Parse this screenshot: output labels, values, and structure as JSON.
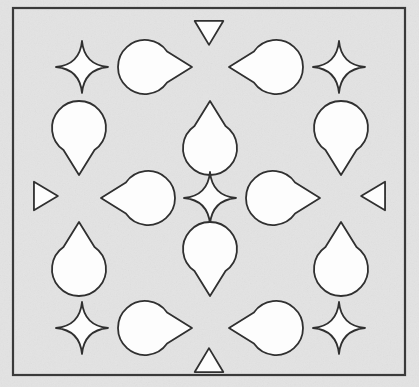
{
  "figure": {
    "canvas": {
      "width": 419,
      "height": 387
    }
  },
  "colors": {
    "page_background": "#ffffff",
    "panel_fill": "#e3e3e3",
    "panel_stroke": "#3a3a3a",
    "shape_fill": "#fdfdfd",
    "shape_stroke": "#303030",
    "noise": "#cfcfcf"
  },
  "frame": {
    "name": "panel-border",
    "x": 13,
    "y": 8,
    "width": 392,
    "height": 367,
    "stroke_width": 2.2
  },
  "geometry": {
    "stroke_width": 1.8,
    "star_radius_outer": 26,
    "star_radius_inner": 7,
    "teardrop_length": 74,
    "teardrop_round_radius": 27,
    "triangle_size": 26
  },
  "shapes": [
    {
      "id": "triangle-top",
      "kind": "triangle",
      "direction": "down",
      "cx": 209,
      "cy": 31,
      "size": 26,
      "label": "top edge triangle pointing down"
    },
    {
      "id": "star-top-left",
      "kind": "star4",
      "cx": 82,
      "cy": 67,
      "r_outer": 26,
      "r_inner": 7,
      "label": "top-left four-pointed star"
    },
    {
      "id": "teardrop-top-left",
      "kind": "teardrop",
      "direction": "right",
      "cx": 155,
      "cy": 67,
      "length": 74,
      "radius": 27,
      "label": "top-left teardrop pointing right"
    },
    {
      "id": "teardrop-top-right",
      "kind": "teardrop",
      "direction": "left",
      "cx": 266,
      "cy": 67,
      "length": 74,
      "radius": 27,
      "label": "top-right teardrop pointing left"
    },
    {
      "id": "star-top-right",
      "kind": "star4",
      "cx": 339,
      "cy": 67,
      "r_outer": 26,
      "r_inner": 7,
      "label": "top-right four-pointed star"
    },
    {
      "id": "teardrop-left-upper",
      "kind": "teardrop",
      "direction": "down",
      "cx": 79,
      "cy": 138,
      "length": 74,
      "radius": 27,
      "label": "upper-left teardrop pointing down"
    },
    {
      "id": "teardrop-center-upper",
      "kind": "teardrop",
      "direction": "up",
      "cx": 210,
      "cy": 138,
      "length": 74,
      "radius": 27,
      "label": "upper-center teardrop pointing up"
    },
    {
      "id": "teardrop-right-upper",
      "kind": "teardrop",
      "direction": "down",
      "cx": 341,
      "cy": 138,
      "length": 74,
      "radius": 27,
      "label": "upper-right teardrop pointing down"
    },
    {
      "id": "triangle-left",
      "kind": "triangle",
      "direction": "right",
      "cx": 44,
      "cy": 196,
      "size": 26,
      "label": "left edge triangle pointing right"
    },
    {
      "id": "teardrop-middle-left",
      "kind": "teardrop",
      "direction": "left",
      "cx": 138,
      "cy": 198,
      "length": 74,
      "radius": 27,
      "label": "middle-left teardrop pointing left"
    },
    {
      "id": "star-center",
      "kind": "star4",
      "cx": 210,
      "cy": 198,
      "r_outer": 26,
      "r_inner": 7,
      "label": "center four-pointed star"
    },
    {
      "id": "teardrop-middle-right",
      "kind": "teardrop",
      "direction": "right",
      "cx": 283,
      "cy": 198,
      "length": 74,
      "radius": 27,
      "label": "middle-right teardrop pointing right"
    },
    {
      "id": "triangle-right",
      "kind": "triangle",
      "direction": "left",
      "cx": 375,
      "cy": 196,
      "size": 26,
      "label": "right edge triangle pointing left"
    },
    {
      "id": "teardrop-left-lower",
      "kind": "teardrop",
      "direction": "up",
      "cx": 79,
      "cy": 259,
      "length": 74,
      "radius": 27,
      "label": "lower-left teardrop pointing up"
    },
    {
      "id": "teardrop-center-lower",
      "kind": "teardrop",
      "direction": "down",
      "cx": 210,
      "cy": 259,
      "length": 74,
      "radius": 27,
      "label": "lower-center teardrop pointing down"
    },
    {
      "id": "teardrop-right-lower",
      "kind": "teardrop",
      "direction": "up",
      "cx": 341,
      "cy": 259,
      "length": 74,
      "radius": 27,
      "label": "lower-right teardrop pointing up"
    },
    {
      "id": "star-bottom-left",
      "kind": "star4",
      "cx": 82,
      "cy": 328,
      "r_outer": 26,
      "r_inner": 7,
      "label": "bottom-left four-pointed star"
    },
    {
      "id": "teardrop-bottom-left",
      "kind": "teardrop",
      "direction": "right",
      "cx": 155,
      "cy": 328,
      "length": 74,
      "radius": 27,
      "label": "bottom-left teardrop pointing right"
    },
    {
      "id": "teardrop-bottom-right",
      "kind": "teardrop",
      "direction": "left",
      "cx": 266,
      "cy": 328,
      "length": 74,
      "radius": 27,
      "label": "bottom-right teardrop pointing left"
    },
    {
      "id": "star-bottom-right",
      "kind": "star4",
      "cx": 339,
      "cy": 328,
      "r_outer": 26,
      "r_inner": 7,
      "label": "bottom-right four-pointed star"
    },
    {
      "id": "triangle-bottom",
      "kind": "triangle",
      "direction": "up",
      "cx": 209,
      "cy": 362,
      "size": 26,
      "label": "bottom edge triangle pointing up"
    }
  ]
}
